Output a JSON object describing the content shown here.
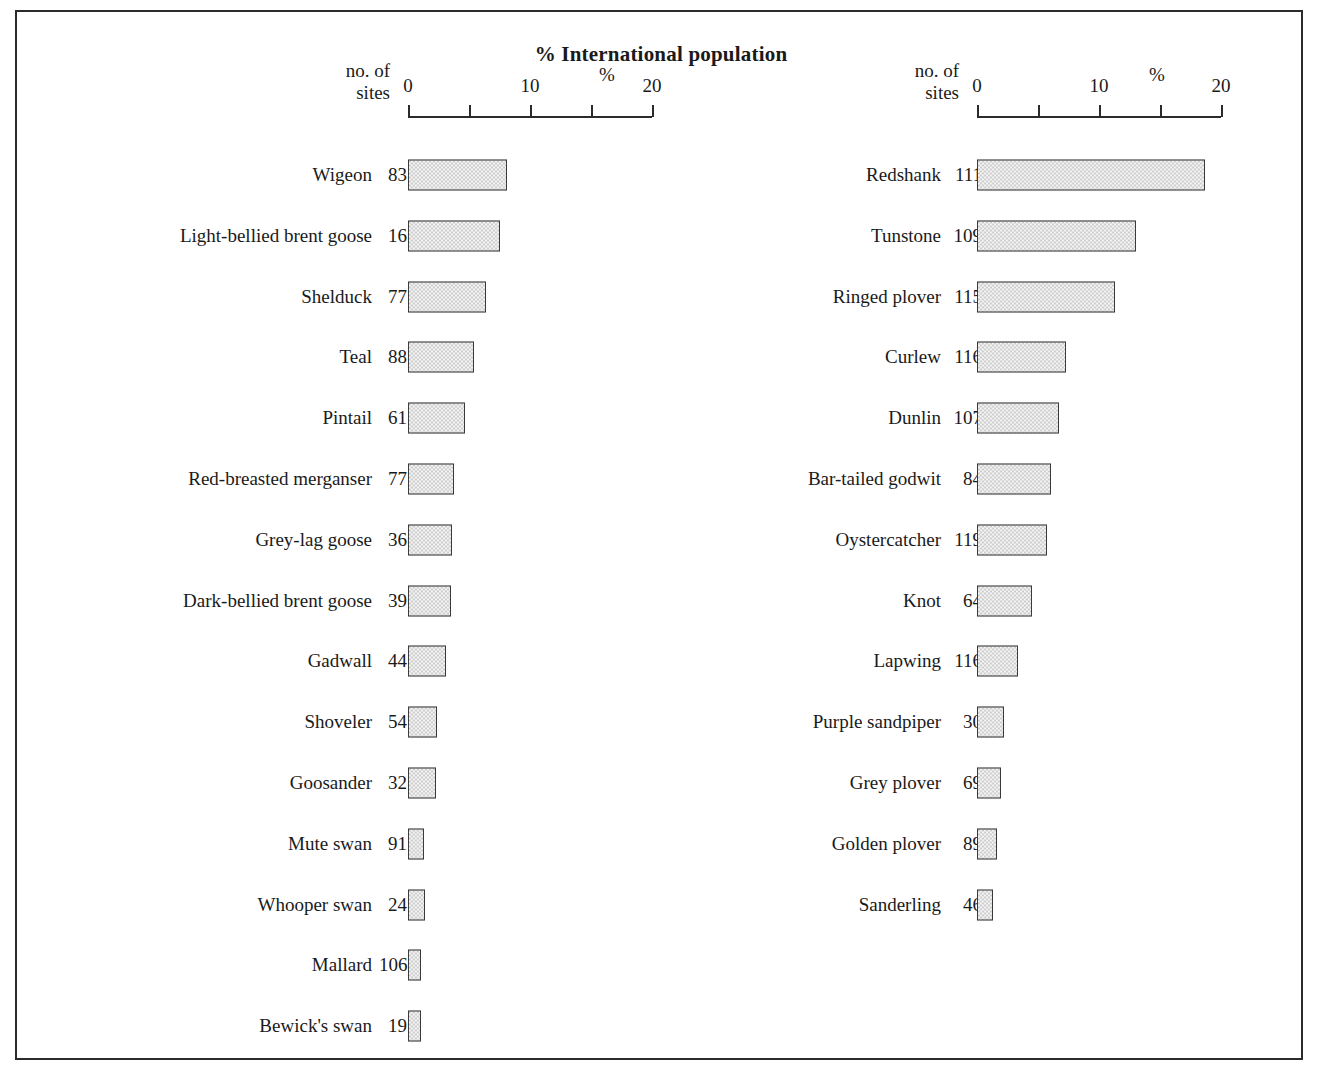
{
  "chart_title": "% International population",
  "panels": {
    "left": {
      "sites_header": "no. of\nsites",
      "pct_header": "%"
    },
    "right": {
      "sites_header": "no. of\nsites",
      "pct_header": "%"
    }
  },
  "axis": {
    "tick_labels": [
      "0",
      "",
      "10",
      "",
      "20"
    ],
    "min": 0,
    "max": 20
  },
  "chart_data": {
    "type": "bar",
    "orientation": "horizontal",
    "title": "% International population",
    "xlabel": "%",
    "ylabel": "",
    "xlim": [
      0,
      20
    ],
    "xticks": [
      0,
      5,
      10,
      15,
      20
    ],
    "xtick_labels": [
      "0",
      "",
      "10",
      "",
      "20"
    ],
    "grid": false,
    "legend": false,
    "extra_column": "no. of sites",
    "panels": [
      {
        "name": "left",
        "categories": [
          "Wigeon",
          "Light-bellied brent goose",
          "Shelduck",
          "Teal",
          "Pintail",
          "Red-breasted merganser",
          "Grey-lag goose",
          "Dark-bellied brent goose",
          "Gadwall",
          "Shoveler",
          "Goosander",
          "Mute swan",
          "Whooper swan",
          "Mallard",
          "Bewick's swan"
        ],
        "sites": [
          83,
          16,
          77,
          88,
          61,
          77,
          36,
          39,
          44,
          54,
          32,
          91,
          24,
          106,
          19
        ],
        "values": [
          8.1,
          7.5,
          6.4,
          5.4,
          4.7,
          3.8,
          3.6,
          3.5,
          3.1,
          2.4,
          2.3,
          1.3,
          1.4,
          1.1,
          1.1
        ]
      },
      {
        "name": "right",
        "categories": [
          "Redshank",
          "Tunstone",
          "Ringed plover",
          "Curlew",
          "Dunlin",
          "Bar-tailed godwit",
          "Oystercatcher",
          "Knot",
          "Lapwing",
          "Purple sandpiper",
          "Grey plover",
          "Golden plover",
          "Sanderling"
        ],
        "sites": [
          111,
          109,
          115,
          116,
          107,
          84,
          119,
          64,
          116,
          30,
          69,
          89,
          46
        ],
        "values": [
          18.7,
          13.0,
          11.3,
          7.3,
          6.7,
          6.1,
          5.7,
          4.5,
          3.4,
          2.2,
          2.0,
          1.6,
          1.3
        ]
      }
    ]
  },
  "style": {
    "bar_fill": "#cdcdcd",
    "bar_border": "#3a3a3a",
    "frame": "#2b2b2b",
    "text": "#1a1a1a"
  }
}
